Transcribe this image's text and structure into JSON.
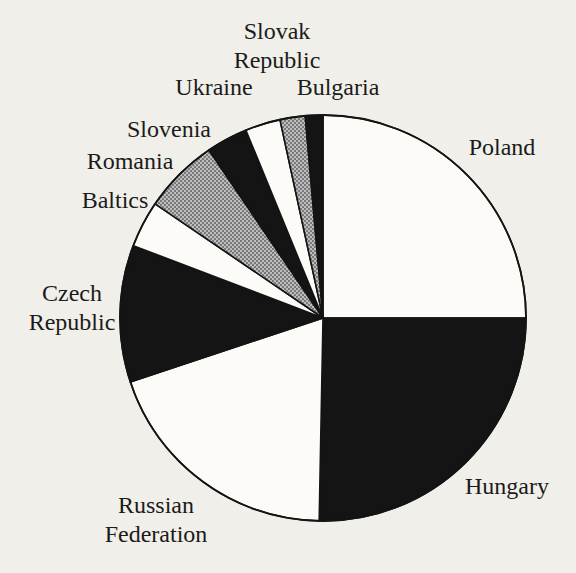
{
  "figure": {
    "background_color": "#f1efe9",
    "ink_color": "#141414",
    "paper_white": "#fcfbf8",
    "halftone_gray": "#ababab"
  },
  "chart_data": {
    "type": "pie",
    "title": "",
    "unit": "percent (estimated from slice arc angles; no numeric values printed in figure)",
    "start_angle_deg": 0,
    "direction": "clockwise",
    "legend_position": "none",
    "pie_geometry": {
      "cx": 323,
      "cy": 318,
      "r": 203
    },
    "segments": [
      {
        "label": "Poland",
        "value": 25.0,
        "fill": "white"
      },
      {
        "label": "Hungary",
        "value": 25.3,
        "fill": "black"
      },
      {
        "label": "Russian Federation",
        "value": 19.6,
        "fill": "white"
      },
      {
        "label": "Czech Republic",
        "value": 10.9,
        "fill": "black"
      },
      {
        "label": "Baltics",
        "value": 3.7,
        "fill": "white"
      },
      {
        "label": "Romania",
        "value": 6.0,
        "fill": "gray-halftone"
      },
      {
        "label": "Slovenia",
        "value": 3.3,
        "fill": "black"
      },
      {
        "label": "Ukraine",
        "value": 2.8,
        "fill": "white"
      },
      {
        "label": "Slovak Republic",
        "value": 2.0,
        "fill": "gray-halftone"
      },
      {
        "label": "Bulgaria",
        "value": 1.4,
        "fill": "black"
      }
    ],
    "labels": [
      {
        "for": "Slovak Republic",
        "lines": [
          "Slovak",
          "Republic"
        ],
        "x": 277,
        "y": 33
      },
      {
        "for": "Ukraine",
        "lines": [
          "Ukraine"
        ],
        "x": 214,
        "y": 89
      },
      {
        "for": "Bulgaria",
        "lines": [
          "Bulgaria"
        ],
        "x": 338,
        "y": 89
      },
      {
        "for": "Slovenia",
        "lines": [
          "Slovenia"
        ],
        "x": 169,
        "y": 131
      },
      {
        "for": "Romania",
        "lines": [
          "Romania"
        ],
        "x": 130,
        "y": 163
      },
      {
        "for": "Baltics",
        "lines": [
          "Baltics"
        ],
        "x": 115,
        "y": 202
      },
      {
        "for": "Czech Republic",
        "lines": [
          "Czech",
          "Republic"
        ],
        "x": 72,
        "y": 295
      },
      {
        "for": "Russian Federation",
        "lines": [
          "Russian",
          "Federation"
        ],
        "x": 156,
        "y": 507
      },
      {
        "for": "Hungary",
        "lines": [
          "Hungary"
        ],
        "x": 507,
        "y": 488
      },
      {
        "for": "Poland",
        "lines": [
          "Poland"
        ],
        "x": 502,
        "y": 149
      }
    ],
    "label_line_height": 29
  }
}
